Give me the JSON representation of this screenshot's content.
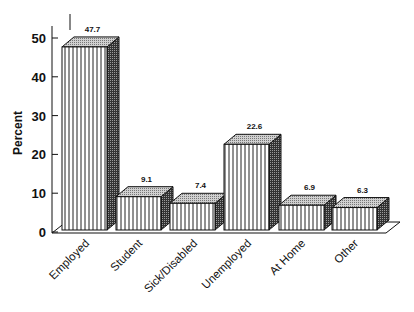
{
  "chart_data": {
    "type": "bar",
    "title": "",
    "xlabel": "",
    "ylabel": "Percent",
    "ylim": [
      0,
      50
    ],
    "yticks": [
      0,
      10,
      20,
      30,
      40,
      50
    ],
    "grid": false,
    "legend": null,
    "style": "3d-bars-vertical-hatch",
    "categories": [
      "Employed",
      "Student",
      "Sick/Disabled",
      "Unemployed",
      "At Home",
      "Other"
    ],
    "values": [
      47.7,
      9.1,
      7.4,
      22.6,
      6.9,
      6.3
    ],
    "value_labels": [
      "47.7",
      "9.1",
      "7.4",
      "22.6",
      "6.9",
      "6.3"
    ]
  },
  "axis": {
    "ylabel": "Percent",
    "ticks": [
      "0",
      "10",
      "20",
      "30",
      "40",
      "50"
    ]
  },
  "colors": {
    "ink": "#111111",
    "bar_face": "#ffffff",
    "bar_side": "#555555",
    "bar_top": "#b8b8b8"
  }
}
